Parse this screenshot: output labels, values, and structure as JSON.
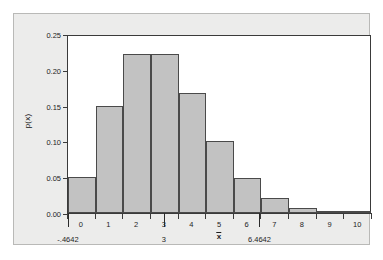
{
  "figure": {
    "top_artifact_text": "",
    "background_color": "#ececeb",
    "bar_fill_color": "#c2c2c2",
    "bar_border_color": "#4a4a4a",
    "axis_color": "#3a3a3a"
  },
  "chart_data": {
    "type": "bar",
    "title": "",
    "xlabel": "",
    "ylabel": "p(x)",
    "categories": [
      "0",
      "1",
      "2",
      "3",
      "4",
      "5",
      "6",
      "7",
      "8",
      "9",
      "10"
    ],
    "values": [
      0.05,
      0.15,
      0.2225,
      0.2225,
      0.168,
      0.1005,
      0.0485,
      0.0205,
      0.0065,
      0.0018,
      0.0005
    ],
    "ylim": [
      0.0,
      0.25
    ],
    "xlim": [
      -0.5,
      10.5
    ],
    "ytick_labels": [
      "0.25",
      "0.20",
      "0.15",
      "0.10",
      "0.05",
      "0.00"
    ],
    "ytick_values": [
      0.25,
      0.2,
      0.15,
      0.1,
      0.05,
      0.0
    ],
    "xtick_labels": [
      "0",
      "1",
      "2",
      "3",
      "4",
      "5",
      "6",
      "7",
      "8",
      "9",
      "10"
    ],
    "grid": false,
    "legend": null,
    "annotations": [
      {
        "name": "lower-bound",
        "label": "-.4642",
        "x": -0.4642
      },
      {
        "name": "mean",
        "label": "3",
        "x": 3.0
      },
      {
        "name": "mean-symbol",
        "label_base": "x",
        "x": 5.0
      },
      {
        "name": "upper-bound",
        "label": "6.4642",
        "x": 6.4642
      }
    ]
  }
}
